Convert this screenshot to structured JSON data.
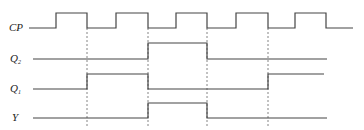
{
  "diagram": {
    "type": "timing-diagram",
    "signals": [
      {
        "name": "CP",
        "sub": "",
        "label_y": 31,
        "high_y": 13,
        "low_y": 28,
        "points": "29,28 56,28 56,13 87,13 87,28 116,28 116,13 148,13 148,28 207,28 207,28 207,28 236,28 236,13 268,13 268,28 295,28 295,13 326,13 326,28 353,28"
      },
      {
        "name": "Q",
        "sub": "2",
        "label_y": 62,
        "high_y": 43,
        "low_y": 59,
        "points": "33,59 148,59 148,43 207,43 207,59 327,59"
      },
      {
        "name": "Q",
        "sub": "1",
        "label_y": 92,
        "high_y": 74,
        "low_y": 89,
        "points": "33,89 87,89 87,74 148,74 148,89 268,89 268,74 324,74"
      },
      {
        "name": "Y",
        "sub": "",
        "label_y": 121,
        "high_y": 103,
        "low_y": 118,
        "points": "33,118 148,118 148,103 207,103 207,118 327,118"
      }
    ],
    "dashed_lines_x": [
      87,
      148,
      207,
      268
    ],
    "dashed_y_range": [
      28,
      126
    ]
  }
}
